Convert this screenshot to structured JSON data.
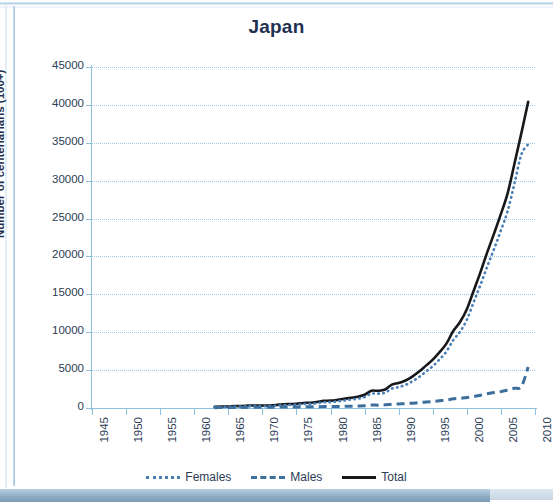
{
  "chart_data": {
    "type": "line",
    "title": "Japan",
    "xlabel": "",
    "ylabel": "Number of centenarians (100+)",
    "xlim": [
      1945,
      2010
    ],
    "ylim": [
      0,
      45000
    ],
    "ytick_labels": [
      "45000",
      "40000",
      "35000",
      "30000",
      "25000",
      "20000",
      "15000",
      "10000",
      "5000",
      "0"
    ],
    "ytick_values": [
      45000,
      40000,
      35000,
      30000,
      25000,
      20000,
      15000,
      10000,
      5000,
      0
    ],
    "xtick_labels": [
      "1945",
      "1950",
      "1955",
      "1960",
      "1965",
      "1970",
      "1975",
      "1980",
      "1985",
      "1990",
      "1995",
      "2000",
      "2005",
      "2010"
    ],
    "xtick_values": [
      1945,
      1950,
      1955,
      1960,
      1965,
      1970,
      1975,
      1980,
      1985,
      1990,
      1995,
      2000,
      2005,
      2010
    ],
    "grid": "horizontal-dotted",
    "legend_position": "bottom-center",
    "x": [
      1963,
      1964,
      1965,
      1966,
      1967,
      1968,
      1969,
      1970,
      1971,
      1972,
      1973,
      1974,
      1975,
      1976,
      1977,
      1978,
      1979,
      1980,
      1981,
      1982,
      1983,
      1984,
      1985,
      1986,
      1987,
      1988,
      1989,
      1990,
      1991,
      1992,
      1993,
      1994,
      1995,
      1996,
      1997,
      1998,
      1999,
      2000,
      2001,
      2002,
      2003,
      2004,
      2005,
      2006,
      2007,
      2008,
      2009
    ],
    "series": [
      {
        "name": "Total",
        "style": "solid",
        "color": "#16181c",
        "values": [
          153,
          191,
          198,
          253,
          253,
          327,
          331,
          310,
          339,
          405,
          495,
          527,
          548,
          667,
          697,
          792,
          937,
          968,
          1072,
          1210,
          1354,
          1490,
          1740,
          2271,
          2271,
          2448,
          3078,
          3298,
          3625,
          4152,
          4802,
          5593,
          6378,
          7373,
          8491,
          10158,
          11346,
          13036,
          15475,
          17934,
          20561,
          23038,
          25606,
          28395,
          32295,
          36276,
          40399
        ],
        "endpoint": {
          "x": 2009,
          "y": 40399
        }
      },
      {
        "name": "Females",
        "style": "dotted",
        "color": "#4a7fb5",
        "values": [
          109,
          136,
          143,
          183,
          182,
          238,
          240,
          226,
          249,
          302,
          370,
          400,
          416,
          516,
          546,
          626,
          747,
          778,
          869,
          986,
          1112,
          1223,
          1443,
          1891,
          1891,
          2034,
          2564,
          2754,
          3049,
          3512,
          4097,
          4807,
          5512,
          6420,
          7448,
          8951,
          10064,
          11640,
          13968,
          16254,
          18689,
          21002,
          23448,
          26027,
          29682,
          33456,
          34800
        ],
        "endpoint": {
          "x": 2009,
          "y": 34800
        }
      },
      {
        "name": "Males",
        "style": "dashed",
        "color": "#3d6f9e",
        "values": [
          44,
          55,
          55,
          70,
          71,
          89,
          91,
          84,
          90,
          103,
          125,
          127,
          132,
          151,
          151,
          166,
          190,
          190,
          203,
          224,
          242,
          267,
          297,
          380,
          380,
          414,
          514,
          544,
          576,
          640,
          705,
          786,
          866,
          953,
          1043,
          1207,
          1282,
          1396,
          1507,
          1680,
          1872,
          2036,
          2158,
          2368,
          2613,
          2820,
          5400
        ],
        "endpoint": {
          "x": 2009,
          "y": 5400
        }
      }
    ],
    "legend": [
      {
        "label": "Females",
        "style": "dotted",
        "color": "#4a7fb5"
      },
      {
        "label": "Males",
        "style": "dashed",
        "color": "#3d6f9e"
      },
      {
        "label": "Total",
        "style": "solid",
        "color": "#16181c"
      }
    ]
  }
}
